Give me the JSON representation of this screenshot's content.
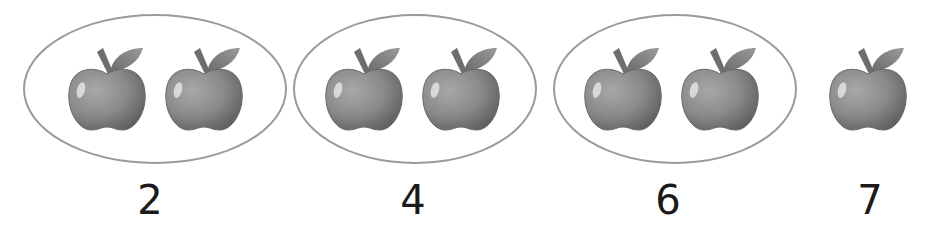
{
  "figure": {
    "colors": {
      "oval_stroke": "#9a9a9a",
      "apple_body": "#8a8a8a",
      "apple_dark": "#5e5e5e",
      "leaf": "#7a7a7a",
      "label_text": "#1a1a1a"
    },
    "groups": [
      {
        "apples": 2,
        "label": "2",
        "circled": true
      },
      {
        "apples": 2,
        "label": "4",
        "circled": true
      },
      {
        "apples": 2,
        "label": "6",
        "circled": true
      },
      {
        "apples": 1,
        "label": "7",
        "circled": false
      }
    ],
    "total_apples": 7
  }
}
